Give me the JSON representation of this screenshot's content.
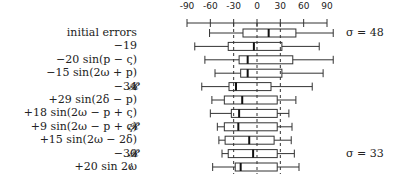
{
  "chart_data": {
    "type": "box",
    "title": "",
    "xlabel": "",
    "ylabel": "",
    "xlim": [
      -90,
      90
    ],
    "x_ticks": [
      -90,
      -60,
      -30,
      0,
      30,
      60,
      90
    ],
    "reference_lines": [
      -30,
      0,
      30
    ],
    "grid": false,
    "rows": [
      {
        "label": "initial errors",
        "mark": "",
        "whisker_low": -61,
        "q1": -18,
        "median": 15,
        "q3": 50,
        "whisker_high": 98
      },
      {
        "label": "−19",
        "mark": "",
        "whisker_low": -80,
        "q1": -37,
        "median": -4,
        "q3": 32,
        "whisker_high": 80
      },
      {
        "label": "−20 sin(p − ς)",
        "mark": "",
        "whisker_low": -67,
        "q1": -23,
        "median": -12,
        "q3": 46,
        "whisker_high": 98
      },
      {
        "label": "−15 sin(2ω + p)",
        "mark": "",
        "whisker_low": -54,
        "q1": -21,
        "median": -12,
        "q3": 32,
        "whisker_high": 85
      },
      {
        "label": "−34",
        "mark": "𝓡",
        "whisker_low": -71,
        "q1": -36,
        "median": -27,
        "q3": 18,
        "whisker_high": 71
      },
      {
        "label": "+29 sin(2δ − p)",
        "mark": "",
        "whisker_low": -58,
        "q1": -42,
        "median": -19,
        "q3": 26,
        "whisker_high": 50
      },
      {
        "label": "+18 sin(2ω − p + ς)",
        "mark": "",
        "whisker_low": -60,
        "q1": -33,
        "median": -23,
        "q3": 26,
        "whisker_high": 41
      },
      {
        "label": "+9 sin(2ω − p + ς)",
        "mark": "𝓡",
        "whisker_low": -51,
        "q1": -42,
        "median": -24,
        "q3": 26,
        "whisker_high": 45
      },
      {
        "label": "+15 sin(2ω − 2δ)",
        "mark": "",
        "whisker_low": -49,
        "q1": -41,
        "median": -10,
        "q3": 22,
        "whisker_high": 44
      },
      {
        "label": "−30",
        "mark": "𝓡",
        "whisker_low": -45,
        "q1": -37,
        "median": -5,
        "q3": 26,
        "whisker_high": 48
      },
      {
        "label": "+20 sin 2ω",
        "mark": "≀",
        "whisker_low": -57,
        "q1": -28,
        "median": -21,
        "q3": 26,
        "whisker_high": 54
      }
    ],
    "annotations": [
      {
        "row": 0,
        "text": "σ = 48"
      },
      {
        "row": 9,
        "text": "σ = 33"
      }
    ]
  }
}
